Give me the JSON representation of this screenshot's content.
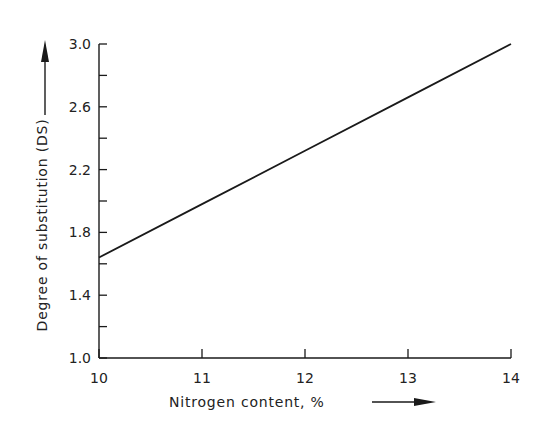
{
  "chart_data": {
    "type": "line",
    "title": "",
    "xlabel": "Nitrogen content, %",
    "ylabel": "Degree of substitution (DS)",
    "xlim": [
      10,
      14
    ],
    "ylim": [
      1.0,
      3.0
    ],
    "x_ticks": [
      10,
      11,
      12,
      13,
      14
    ],
    "x_tick_labels": [
      "10",
      "11",
      "12",
      "13",
      "14"
    ],
    "y_ticks_major": [
      1.0,
      1.4,
      1.8,
      2.2,
      2.6,
      3.0
    ],
    "y_tick_labels": [
      "1.0",
      "1.4",
      "1.8",
      "2.2",
      "2.6",
      "3.0"
    ],
    "y_ticks_minor": [
      1.2,
      1.6,
      2.0,
      2.4,
      2.8
    ],
    "grid": false,
    "legend": null,
    "series": [
      {
        "name": "DS vs nitrogen content",
        "x": [
          10,
          11,
          12,
          13,
          14
        ],
        "y": [
          1.64,
          1.98,
          2.32,
          2.66,
          3.0
        ]
      }
    ],
    "annotations": [
      "arrow along y-axis label",
      "arrow along x-axis label"
    ]
  },
  "colors": {
    "line": "#1a1a1a",
    "axis": "#1a1a1a",
    "background": "#ffffff"
  }
}
